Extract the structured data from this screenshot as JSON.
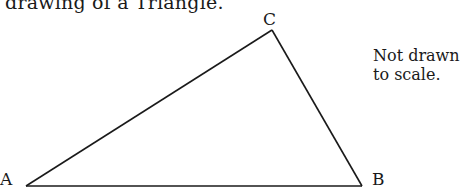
{
  "caption": "t drawing of a Triangle.",
  "triangle": {
    "stroke_color": "#1a1a1a",
    "vertices": {
      "A": {
        "label": "A",
        "x": 26,
        "y": 186
      },
      "B": {
        "label": "B",
        "x": 362,
        "y": 186
      },
      "C": {
        "label": "C",
        "x": 272,
        "y": 30
      }
    }
  },
  "note": {
    "line1": "Not drawn",
    "line2": "to scale."
  }
}
